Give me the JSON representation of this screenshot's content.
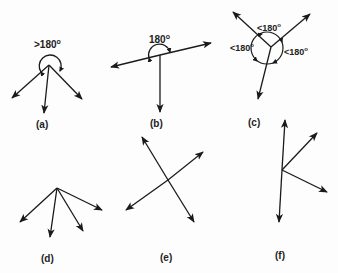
{
  "figure": {
    "panels": [
      {
        "id": "a",
        "label": "(a)",
        "angle_label": ">180",
        "degree_mark": "o",
        "description": "Three vectors all pointing downward from a common point; angle annotated greater than 180 degrees"
      },
      {
        "id": "b",
        "label": "(b)",
        "angle_label": "180",
        "degree_mark": "o",
        "description": "Two opposite vectors along a straight line plus one pointing down; angle annotated 180 degrees"
      },
      {
        "id": "c",
        "label": "(c)",
        "angle_labels": [
          "<180",
          "<180",
          "<180"
        ],
        "degree_mark": "o",
        "description": "Three vectors spread around a point; each angle between neighbours less than 180 degrees"
      },
      {
        "id": "d",
        "label": "(d)",
        "description": "Four vectors fanning downward from a common point"
      },
      {
        "id": "e",
        "label": "(e)",
        "description": "Two crossing double-headed lines (four vectors from crossing point)"
      },
      {
        "id": "f",
        "label": "(f)",
        "description": "Vertical double-headed line with two vectors branching to the right"
      }
    ],
    "colors": {
      "stroke": "#1a1a1a",
      "background": "#fdfdfd"
    }
  }
}
